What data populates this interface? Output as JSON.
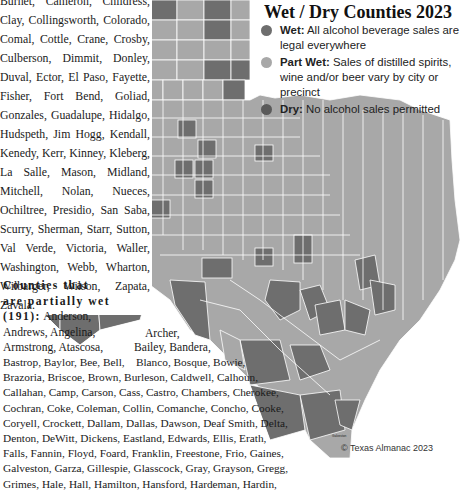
{
  "legend": {
    "title": "Wet / Dry Counties 2023",
    "items": [
      {
        "key": "wet",
        "label": "Wet:",
        "description": "All alcohol beverage sales are legal everywhere",
        "color": "#6e6e6e"
      },
      {
        "key": "part_wet",
        "label": "Part Wet:",
        "description": "Sales of distilled spirits, wine and/or beer vary by city or precinct",
        "color": "#a8a8a8"
      },
      {
        "key": "dry",
        "label": "Dry:",
        "description": "No alcohol sales permitted",
        "color": "#5a5a5a"
      }
    ]
  },
  "wet_counties_text": "Burnet, Cameron, Childress, Clay, Collingsworth, Colorado, Comal, Cottle, Crane, Crosby, Culberson, Dimmit, Donley, Duval, Ector, El Paso, Fayette, Fisher, Fort Bend, Goliad, Gonzales, Guadalupe, Hidalgo, Hudspeth, Jim Hogg, Kendall, Kenedy, Kerr, Kinney, Kleberg, La Salle, Mason, Midland, Mitchell, Nolan, Nueces, Ochiltree, Presidio, San Saba, Scurry, Sherman, Starr, Sutton, Val Verde, Victoria, Waller, Washington, Webb, Wharton, Wilbarger, Wilson, Zapata, Zavala.",
  "partial_wet": {
    "heading": "Counties that are partially wet (191):",
    "lines": [
      "Anderson,",
      "Andrews, Angelina,",
      "Armstrong, Atascosa,",
      "Bastrop, Baylor, Bee, Bell,",
      "Brazoria, Briscoe, Brown, Burleson, Caldwell, Calhoun,",
      "Callahan, Camp, Carson, Cass, Castro, Chambers, Cherokee,",
      "Cochran, Coke, Coleman, Collin, Comanche, Concho, Cooke,",
      "Coryell, Crockett, Dallam, Dallas, Dawson, Deaf Smith, Delta,",
      "Denton, DeWitt, Dickens, Eastland, Edwards, Ellis, Erath,",
      "Falls, Fannin, Floyd, Foard, Franklin, Freestone, Frio, Gaines,",
      "Galveston, Garza, Gillespie, Glasscock, Gray, Grayson, Gregg,",
      "Grimes, Hale, Hall, Hamilton, Hansford, Hardeman, Hardin,"
    ],
    "float_right": [
      "Archer,",
      "Bailey, Bandera,",
      "Blanco, Bosque, Bowie,"
    ]
  },
  "credit": "© Texas Almanac 2023",
  "map": {
    "colors": {
      "wet": "#6e6e6e",
      "part_wet": "#a8a8a8",
      "dry": "#5a5a5a",
      "border": "#ffffff"
    },
    "panhandle_labels": [
      [
        "Dallam",
        "Sherman",
        "Hansford",
        "Ochiltree",
        "Lipscomb"
      ],
      [
        "Hartley",
        "Moore",
        "Hutchinson",
        "Roberts",
        "Hemphill"
      ],
      [
        "Oldham",
        "Potter",
        "Carson",
        "Gray",
        "Wheeler"
      ],
      [
        "Deaf Smith",
        "Randall",
        "Armstrong",
        "Donley",
        "Collingsworth"
      ],
      [
        "Parmer",
        "Castro",
        "Swisher",
        "Briscoe",
        "Hall",
        "Childress"
      ],
      [
        "Bailey",
        "Lamb",
        "Hale",
        "Floyd",
        "Motley",
        "Cottle"
      ]
    ],
    "place_labels": [
      "Galveston",
      "Aransas",
      "El Paso",
      "Hudspeth",
      "Culberson",
      "Presidio",
      "Brewster",
      "Terrell",
      "Val Verde",
      "Pecos"
    ]
  }
}
